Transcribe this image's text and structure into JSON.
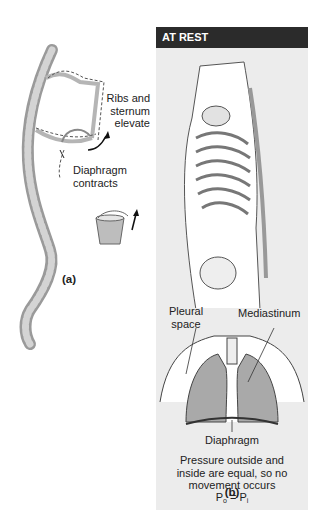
{
  "panel_a": {
    "labels": {
      "ribs_line1": "Ribs and",
      "ribs_line2": "sternum",
      "ribs_line3": "elevate",
      "diaphragm_line1": "Diaphragm",
      "diaphragm_line2": "contracts"
    },
    "caption": "(a)"
  },
  "panel_b": {
    "header": "AT REST",
    "labels": {
      "pleural_line1": "Pleural",
      "pleural_line2": "space",
      "mediastinum": "Mediastinum",
      "diaphragm": "Diaphragm"
    },
    "description_line1": "Pressure outside and",
    "description_line2": "inside are equal, so no",
    "description_line3": "movement occurs",
    "equation": {
      "p": "P",
      "sub_o": "o",
      "equals": " = ",
      "sub_i": "i"
    },
    "caption": "(b)"
  },
  "colors": {
    "header_bg": "#2b2b2b",
    "panel_bg": "#ececec",
    "lung_fill": "#a9a9a9",
    "bone": "#c8c8c8"
  }
}
